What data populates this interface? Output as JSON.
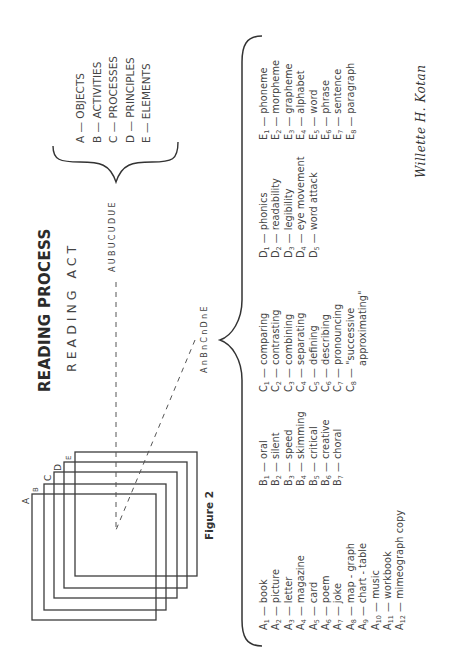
{
  "title": "READING PROCESS",
  "subtitle": "READING ACT",
  "union_label": "AUBUCUDUE",
  "intersection_label": "AnBnCnDnE",
  "figure_caption": "Figure 2",
  "square_labels": [
    "A",
    "B",
    "C",
    "D",
    "E"
  ],
  "legend": [
    {
      "key": "A",
      "label": "OBJECTS"
    },
    {
      "key": "B",
      "label": "ACTIVITIES"
    },
    {
      "key": "C",
      "label": "PROCESSES"
    },
    {
      "key": "D",
      "label": "PRINCIPLES"
    },
    {
      "key": "E",
      "label": "ELEMENTS"
    }
  ],
  "lists": {
    "A": [
      {
        "sub": "1",
        "text": "book"
      },
      {
        "sub": "2",
        "text": "picture"
      },
      {
        "sub": "3",
        "text": "letter"
      },
      {
        "sub": "4",
        "text": "magazine"
      },
      {
        "sub": "5",
        "text": "card"
      },
      {
        "sub": "6",
        "text": "poem"
      },
      {
        "sub": "7",
        "text": "joke"
      },
      {
        "sub": "8",
        "text": "map - graph"
      },
      {
        "sub": "9",
        "text": "chart - table"
      },
      {
        "sub": "10",
        "text": "music"
      },
      {
        "sub": "11",
        "text": "workbook"
      },
      {
        "sub": "12",
        "text": "mimeograph copy"
      }
    ],
    "B": [
      {
        "sub": "1",
        "text": "oral"
      },
      {
        "sub": "2",
        "text": "silent"
      },
      {
        "sub": "3",
        "text": "speed"
      },
      {
        "sub": "4",
        "text": "skimming"
      },
      {
        "sub": "5",
        "text": "critical"
      },
      {
        "sub": "6",
        "text": "creative"
      },
      {
        "sub": "7",
        "text": "choral"
      }
    ],
    "C": [
      {
        "sub": "1",
        "text": "comparing"
      },
      {
        "sub": "2",
        "text": "contrasting"
      },
      {
        "sub": "3",
        "text": "combining"
      },
      {
        "sub": "4",
        "text": "separating"
      },
      {
        "sub": "5",
        "text": "defining"
      },
      {
        "sub": "6",
        "text": "describing"
      },
      {
        "sub": "7",
        "text": "pronouncing"
      },
      {
        "sub": "8",
        "text": "\"successive"
      },
      {
        "sub": "",
        "text": "approximating\""
      }
    ],
    "D": [
      {
        "sub": "1",
        "text": "phonics"
      },
      {
        "sub": "2",
        "text": "readability"
      },
      {
        "sub": "3",
        "text": "legibility"
      },
      {
        "sub": "4",
        "text": "eye movement"
      },
      {
        "sub": "5",
        "text": "word attack"
      }
    ],
    "E": [
      {
        "sub": "1",
        "text": "phoneme"
      },
      {
        "sub": "2",
        "text": "morpheme"
      },
      {
        "sub": "3",
        "text": "grapheme"
      },
      {
        "sub": "4",
        "text": "alphabet"
      },
      {
        "sub": "5",
        "text": "word"
      },
      {
        "sub": "6",
        "text": "phrase"
      },
      {
        "sub": "7",
        "text": "sentence"
      },
      {
        "sub": "8",
        "text": "paragraph"
      }
    ]
  },
  "signature": "Willette H. Kotan",
  "dash": "—"
}
